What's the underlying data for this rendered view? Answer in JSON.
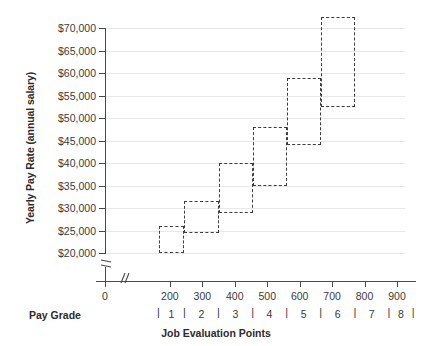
{
  "chart_data": {
    "type": "bar",
    "subtype": "pay-grade-range-boxes",
    "title": "",
    "xlabel": "Job Evaluation Points",
    "ylabel": "Yearly Pay Rate (annual salary)",
    "secondary_xlabel": "Pay Grade",
    "xlim": [
      0,
      900
    ],
    "ylim": [
      20000,
      72500
    ],
    "y_axis_broken": true,
    "x_axis_broken": true,
    "grid": true,
    "legend": "none",
    "x_ticks": [
      0,
      200,
      300,
      400,
      500,
      600,
      700,
      800,
      900
    ],
    "x_tick_labels": [
      "0",
      "200",
      "300",
      "400",
      "500",
      "600",
      "700",
      "800",
      "900"
    ],
    "y_ticks": [
      20000,
      25000,
      30000,
      35000,
      40000,
      45000,
      50000,
      55000,
      60000,
      65000,
      70000
    ],
    "y_tick_labels": [
      "$20,000",
      "$25,000",
      "$30,000",
      "$35,000",
      "$40,000",
      "$45,000",
      "$50,000",
      "$55,000",
      "$60,000",
      "$65,000",
      "$70,000"
    ],
    "pay_grades": [
      "1",
      "2",
      "3",
      "4",
      "5",
      "6",
      "7",
      "8"
    ],
    "pay_grade_separators": [
      165,
      245,
      350,
      455,
      560,
      665,
      770,
      875,
      950
    ],
    "pay_grade_centers": [
      205,
      297,
      402,
      507,
      612,
      717,
      822,
      912
    ],
    "boxes": [
      {
        "grade": "1",
        "points_min": 165,
        "points_max": 245,
        "salary_min": 20000,
        "salary_max": 26000
      },
      {
        "grade": "2",
        "points_min": 245,
        "points_max": 350,
        "salary_min": 24500,
        "salary_max": 31500
      },
      {
        "grade": "3",
        "points_min": 350,
        "points_max": 455,
        "salary_min": 29000,
        "salary_max": 40000
      },
      {
        "grade": "4",
        "points_min": 455,
        "points_max": 560,
        "salary_min": 35000,
        "salary_max": 48000
      },
      {
        "grade": "5",
        "points_min": 560,
        "points_max": 665,
        "salary_min": 44000,
        "salary_max": 59000
      },
      {
        "grade": "6",
        "points_min": 665,
        "points_max": 770,
        "salary_min": 52500,
        "salary_max": 72500
      }
    ],
    "colors": {
      "box_stroke": "#3c3c3c",
      "axis": "#4a4a4a",
      "grid": "#e8e8e8",
      "text": "#2b2b2b",
      "background": "#ffffff"
    }
  }
}
